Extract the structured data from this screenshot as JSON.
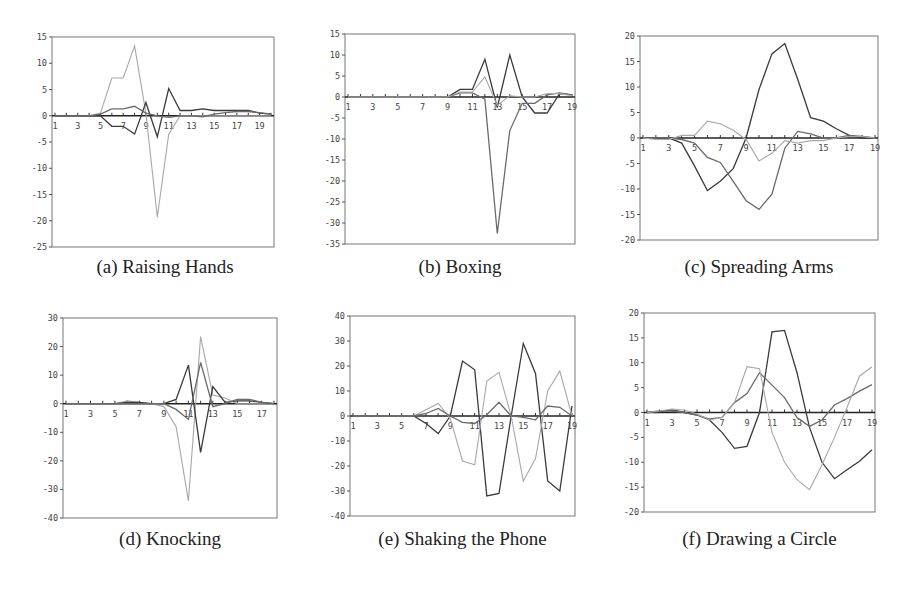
{
  "figure": {
    "captions": [
      "(a) Raising Hands",
      "(b) Boxing",
      "(c) Spreading Arms",
      "(d) Knocking",
      "(e) Shaking the Phone",
      "(f) Drawing a Circle"
    ]
  },
  "colors": {
    "dark": "#3a3a3a",
    "mid": "#6a6a6a",
    "light": "#a8a8a8",
    "axis": "#555555",
    "frame": "#777777"
  },
  "chart_data": [
    {
      "id": "a",
      "type": "line",
      "title": "(a) Raising Hands",
      "xlabel": "",
      "ylabel": "",
      "ylim": [
        -25,
        15
      ],
      "yticks": [
        15,
        10,
        5,
        0,
        -5,
        -10,
        -15,
        -20,
        -25
      ],
      "xticks": [
        1,
        3,
        5,
        7,
        9,
        11,
        13,
        15,
        17,
        19
      ],
      "x": [
        1,
        2,
        3,
        4,
        5,
        6,
        7,
        8,
        9,
        10,
        11,
        12,
        13,
        14,
        15,
        16,
        17,
        18,
        19,
        20
      ],
      "box": {
        "x": 52,
        "y": 37,
        "w": 222,
        "h": 210
      },
      "series": [
        {
          "name": "s1",
          "color": "light",
          "values": [
            0,
            0,
            0,
            0,
            0.5,
            7.2,
            7.2,
            13.3,
            0.5,
            -19.3,
            -3.5,
            0,
            0,
            0,
            0,
            0,
            0,
            0,
            0,
            0
          ]
        },
        {
          "name": "s2",
          "color": "dark",
          "values": [
            0,
            0,
            0,
            0,
            0,
            -2,
            -2,
            -3.5,
            2.5,
            -4,
            5.2,
            1,
            1,
            1.3,
            1,
            1,
            1,
            1,
            0.5,
            0.3
          ]
        },
        {
          "name": "s3",
          "color": "mid",
          "values": [
            0,
            0,
            0,
            0,
            0.3,
            1.3,
            1.3,
            1.8,
            0.5,
            0,
            -0.3,
            0,
            0,
            -0.2,
            0.3,
            0.6,
            0.8,
            0.8,
            0.6,
            0.3
          ]
        }
      ]
    },
    {
      "id": "b",
      "type": "line",
      "title": "(b) Boxing",
      "xlabel": "",
      "ylabel": "",
      "ylim": [
        -35,
        15
      ],
      "yticks": [
        15,
        10,
        5,
        0,
        -5,
        -10,
        -15,
        -20,
        -25,
        -30,
        -35
      ],
      "xticks": [
        1,
        3,
        5,
        7,
        9,
        11,
        13,
        15,
        17,
        19
      ],
      "x": [
        1,
        2,
        3,
        4,
        5,
        6,
        7,
        8,
        9,
        10,
        11,
        12,
        13,
        14,
        15,
        16,
        17,
        18,
        19
      ],
      "box": {
        "x": 345,
        "y": 34,
        "w": 230,
        "h": 210
      },
      "series": [
        {
          "name": "s1",
          "color": "dark",
          "values": [
            0,
            0,
            0,
            0,
            0,
            0,
            0,
            0,
            0,
            1.8,
            1.8,
            9,
            -2.5,
            10,
            0,
            -3.8,
            -3.8,
            0.8,
            0.5
          ]
        },
        {
          "name": "s2",
          "color": "mid",
          "values": [
            0,
            0,
            0,
            0,
            0,
            0,
            0,
            0,
            0,
            1,
            1,
            -0.5,
            -32.5,
            -8,
            -1.5,
            -1.5,
            0.5,
            1,
            0.5
          ]
        },
        {
          "name": "s3",
          "color": "light",
          "values": [
            0,
            0,
            0,
            0,
            0,
            0,
            0,
            0,
            0,
            1.2,
            1.2,
            4.8,
            -2,
            0.3,
            0,
            0,
            0.8,
            0.8,
            0.3
          ]
        }
      ]
    },
    {
      "id": "c",
      "type": "line",
      "title": "(c) Spreading Arms",
      "xlabel": "",
      "ylabel": "",
      "ylim": [
        -20,
        20
      ],
      "yticks": [
        20,
        15,
        10,
        5,
        0,
        -5,
        -10,
        -15,
        -20
      ],
      "xticks": [
        1,
        3,
        5,
        7,
        9,
        11,
        13,
        15,
        17,
        19
      ],
      "x": [
        1,
        2,
        3,
        4,
        5,
        6,
        7,
        8,
        9,
        10,
        11,
        12,
        13,
        14,
        15,
        16,
        17,
        18,
        19
      ],
      "box": {
        "x": 640,
        "y": 36,
        "w": 238,
        "h": 204
      },
      "series": [
        {
          "name": "s1",
          "color": "dark",
          "values": [
            0,
            0,
            0,
            -1,
            -5.5,
            -10.3,
            -8.5,
            -6,
            0,
            9.5,
            16.5,
            18.5,
            11.5,
            4,
            3.3,
            1.8,
            0.5,
            0,
            0
          ]
        },
        {
          "name": "s2",
          "color": "mid",
          "values": [
            0,
            0,
            0,
            -0.3,
            -1,
            -3.8,
            -4.8,
            -8.5,
            -12.3,
            -14,
            -11,
            -2,
            1.3,
            0.8,
            0,
            0,
            0.5,
            0.3,
            0
          ]
        },
        {
          "name": "s3",
          "color": "light",
          "values": [
            0,
            -0.3,
            -0.3,
            0.5,
            0.5,
            3.3,
            2.8,
            1.5,
            -0.3,
            -4.5,
            -3,
            -0.5,
            -1,
            -0.5,
            -0.5,
            0,
            0.3,
            0.3,
            0
          ]
        }
      ]
    },
    {
      "id": "d",
      "type": "line",
      "title": "(d) Knocking",
      "xlabel": "",
      "ylabel": "",
      "ylim": [
        -40,
        30
      ],
      "yticks": [
        30,
        20,
        10,
        0,
        -10,
        -20,
        -30,
        -40
      ],
      "xticks": [
        1,
        3,
        5,
        7,
        9,
        11,
        13,
        15,
        17
      ],
      "x": [
        1,
        2,
        3,
        4,
        5,
        6,
        7,
        8,
        9,
        10,
        11,
        12,
        13,
        14,
        15,
        16,
        17,
        18
      ],
      "box": {
        "x": 63,
        "y": 318,
        "w": 214,
        "h": 200
      },
      "series": [
        {
          "name": "s1",
          "color": "light",
          "values": [
            0,
            0,
            0,
            0,
            0,
            1,
            0.5,
            0,
            -1,
            -8,
            -34,
            23.5,
            3,
            2,
            0,
            0,
            0,
            0
          ]
        },
        {
          "name": "s2",
          "color": "dark",
          "values": [
            0,
            0,
            0,
            0,
            0,
            0.5,
            0.5,
            0,
            0,
            1.5,
            13.5,
            -17,
            6,
            0.5,
            1,
            1,
            0.5,
            0
          ]
        },
        {
          "name": "s3",
          "color": "mid",
          "values": [
            0,
            0,
            0,
            0,
            0,
            0,
            0,
            0,
            0,
            -2,
            -5.5,
            14.5,
            -1,
            0,
            1.5,
            1.5,
            0.5,
            0
          ]
        }
      ]
    },
    {
      "id": "e",
      "type": "line",
      "title": "(e) Shaking the Phone",
      "xlabel": "",
      "ylabel": "",
      "ylim": [
        -40,
        40
      ],
      "yticks": [
        40,
        30,
        20,
        10,
        0,
        -10,
        -20,
        -30,
        -40
      ],
      "xticks": [
        1,
        3,
        5,
        7,
        9,
        11,
        13,
        15,
        17,
        19
      ],
      "x": [
        1,
        2,
        3,
        4,
        5,
        6,
        7,
        8,
        9,
        10,
        11,
        12,
        13,
        14,
        15,
        16,
        17,
        18,
        19
      ],
      "box": {
        "x": 350,
        "y": 316,
        "w": 225,
        "h": 200
      },
      "series": [
        {
          "name": "s1",
          "color": "dark",
          "values": [
            0,
            0,
            0,
            0,
            0,
            0,
            -3,
            -7,
            0,
            22,
            18.5,
            -32,
            -31,
            0,
            29,
            17,
            -26,
            -30,
            4
          ]
        },
        {
          "name": "s2",
          "color": "light",
          "values": [
            0,
            0,
            0,
            0,
            0,
            0,
            2.5,
            5,
            -1,
            -18,
            -19.5,
            14,
            17.5,
            0,
            -26,
            -17,
            10,
            18,
            0
          ]
        },
        {
          "name": "s3",
          "color": "mid",
          "values": [
            0,
            0,
            0,
            0,
            0,
            0,
            1,
            3,
            0,
            -2.5,
            -3,
            0.5,
            5.5,
            0,
            -0.5,
            -1.5,
            4,
            3.5,
            0
          ]
        }
      ]
    },
    {
      "id": "f",
      "type": "line",
      "title": "(f) Drawing a Circle",
      "xlabel": "",
      "ylabel": "",
      "ylim": [
        -20,
        20
      ],
      "yticks": [
        20,
        15,
        10,
        5,
        0,
        -5,
        -10,
        -15,
        -20
      ],
      "xticks": [
        1,
        3,
        5,
        7,
        9,
        11,
        13,
        15,
        17,
        19
      ],
      "x": [
        1,
        2,
        3,
        4,
        5,
        6,
        7,
        8,
        9,
        10,
        11,
        12,
        13,
        14,
        15,
        16,
        17,
        18,
        19
      ],
      "box": {
        "x": 644,
        "y": 313,
        "w": 231,
        "h": 199
      },
      "series": [
        {
          "name": "s1",
          "color": "dark",
          "values": [
            0,
            0.2,
            0.5,
            0,
            -0.5,
            -1.5,
            -4,
            -7.2,
            -6.8,
            0,
            16.2,
            16.5,
            8,
            -3,
            -10,
            -13.3,
            -11.5,
            -9.8,
            -7.5
          ]
        },
        {
          "name": "s2",
          "color": "mid",
          "values": [
            0,
            0.3,
            0.3,
            0,
            -0.5,
            -1.3,
            -1,
            2,
            3.8,
            8,
            5.5,
            3,
            -1,
            -2.8,
            -1.5,
            1.5,
            2.8,
            4.3,
            5.6
          ]
        },
        {
          "name": "s3",
          "color": "light",
          "values": [
            0,
            0.3,
            0.7,
            0.5,
            -0.3,
            -1.5,
            -1,
            2,
            9.2,
            8.8,
            -4,
            -10,
            -13.5,
            -15.5,
            -10.5,
            -5,
            1,
            7.3,
            9.2
          ]
        }
      ]
    }
  ]
}
